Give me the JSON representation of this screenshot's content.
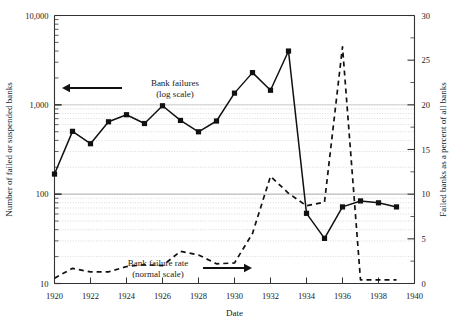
{
  "chart_data": {
    "type": "line",
    "title": "",
    "xlabel": "Date",
    "ylabel": "Number of failed or suspended banks",
    "y2label": "Failed banks as a percent of all banks",
    "xlim": [
      1920,
      1940
    ],
    "ylim": [
      10,
      10000
    ],
    "yscale": "log",
    "y2lim": [
      0,
      30
    ],
    "y2scale": "linear",
    "grid": true,
    "legend_position": "inline-annotations",
    "xticks": [
      1920,
      1922,
      1924,
      1926,
      1928,
      1930,
      1932,
      1934,
      1936,
      1938,
      1940
    ],
    "xticklabels": [
      "1920",
      "1922",
      "1924",
      "1926",
      "1928",
      "1930",
      "1932",
      "1934",
      "1936",
      "1938",
      "1940"
    ],
    "yticks": [
      10,
      100,
      1000,
      10000
    ],
    "yticklabels": [
      "10",
      "100",
      "1,000",
      "10,000"
    ],
    "y2ticks": [
      0,
      5,
      10,
      15,
      20,
      25,
      30
    ],
    "y2ticklabels": [
      "0",
      "5",
      "10",
      "15",
      "20",
      "25",
      "30"
    ],
    "x": [
      1920,
      1921,
      1922,
      1923,
      1924,
      1925,
      1926,
      1927,
      1928,
      1929,
      1930,
      1931,
      1932,
      1933,
      1934,
      1935,
      1936,
      1937,
      1938,
      1939
    ],
    "series": [
      {
        "name": "Bank failures (log scale)",
        "axis": "left",
        "style": "solid",
        "marker": "square",
        "values": [
          168,
          505,
          367,
          646,
          775,
          618,
          976,
          669,
          499,
          659,
          1352,
          2294,
          1456,
          4000,
          61,
          32,
          72,
          84,
          80,
          72
        ]
      },
      {
        "name": "Bank failure rate (normal scale)",
        "axis": "right",
        "style": "dashed",
        "marker": "none",
        "values": [
          0.6,
          1.7,
          1.3,
          1.3,
          1.9,
          2.1,
          2.0,
          3.6,
          3.2,
          2.2,
          2.3,
          5.6,
          12.0,
          10.1,
          8.7,
          9.1,
          26.5,
          0.4,
          0.4,
          0.4
        ]
      }
    ],
    "annotations": [
      {
        "name": "bank-failures-annotation",
        "line1": "Bank failures",
        "line2": "(log scale)",
        "arrow": "left"
      },
      {
        "name": "bank-failure-rate-annotation",
        "line1": "Bank failure rate",
        "line2": "(normal scale)",
        "arrow": "right"
      }
    ]
  },
  "axes": {
    "x_title": "Date",
    "y_left_title": "Number of failed or suspended banks",
    "y_right_title": "Failed banks as a percent of all banks"
  },
  "colors": {
    "line": "#111111",
    "grid": "#b9b9b9",
    "axis": "#333333",
    "background": "#ffffff"
  }
}
